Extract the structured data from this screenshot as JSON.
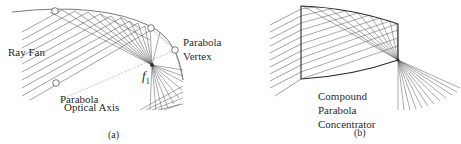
{
  "panel_a": {
    "ray_fan_label": "Ray Fan",
    "vertex_label_line1": "Parabola",
    "vertex_label_line2": "Vertex",
    "axis_label_line1": "Parabola",
    "axis_label_line2": "Optical Axis",
    "focus_label": "f",
    "focus_subscript": "1",
    "caption": "(a)"
  },
  "panel_b": {
    "label_line1": "Compound",
    "label_line2": "Parabola",
    "label_line3": "Concentrator",
    "caption": "(b)"
  },
  "colors": {
    "line": "#3a3a3a",
    "frame": "#2a2a2a",
    "background": "#ffffff"
  }
}
